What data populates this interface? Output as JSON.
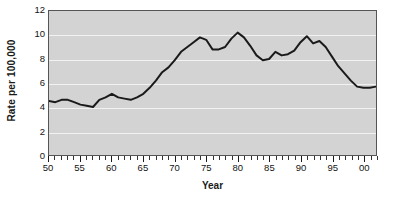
{
  "chart_data": {
    "type": "line",
    "title": "",
    "xlabel": "Year",
    "ylabel": "Rate per 100,000",
    "xlim": [
      50,
      102
    ],
    "ylim": [
      0,
      12
    ],
    "grid": true,
    "legend": false,
    "y_ticks": [
      12,
      10,
      8,
      6,
      4,
      2,
      0
    ],
    "y_tick_labels": [
      "12",
      "10",
      "8",
      "6",
      "4",
      "2",
      "0"
    ],
    "x_ticks": [
      50,
      55,
      60,
      65,
      70,
      75,
      80,
      85,
      90,
      95,
      100
    ],
    "x_tick_labels": [
      "50",
      "55",
      "60",
      "65",
      "70",
      "75",
      "80",
      "85",
      "90",
      "95",
      "00"
    ],
    "x_minor_tick_step": 1,
    "series": [
      {
        "name": "Rate per 100,000",
        "color": "#1a1a1a",
        "line_width": 2,
        "x": [
          50,
          51,
          52,
          53,
          54,
          55,
          56,
          57,
          58,
          59,
          60,
          61,
          62,
          63,
          64,
          65,
          66,
          67,
          68,
          69,
          70,
          71,
          72,
          73,
          74,
          75,
          76,
          77,
          78,
          79,
          80,
          81,
          82,
          83,
          84,
          85,
          86,
          87,
          88,
          89,
          90,
          91,
          92,
          93,
          94,
          95,
          96,
          97,
          98,
          99,
          100,
          101,
          102
        ],
        "values": [
          4.5,
          4.4,
          4.6,
          4.6,
          4.4,
          4.2,
          4.1,
          4.0,
          4.6,
          4.8,
          5.1,
          4.8,
          4.7,
          4.6,
          4.8,
          5.1,
          5.6,
          6.2,
          6.9,
          7.3,
          7.9,
          8.6,
          9.0,
          9.4,
          9.8,
          9.6,
          8.8,
          8.8,
          9.0,
          9.7,
          10.2,
          9.8,
          9.1,
          8.3,
          7.9,
          8.0,
          8.6,
          8.3,
          8.4,
          8.7,
          9.4,
          9.9,
          9.3,
          9.5,
          9.0,
          8.2,
          7.4,
          6.8,
          6.2,
          5.7,
          5.6,
          5.6,
          5.7
        ]
      }
    ]
  },
  "axis": {
    "y_title": "Rate per 100,000",
    "x_title": "Year"
  }
}
